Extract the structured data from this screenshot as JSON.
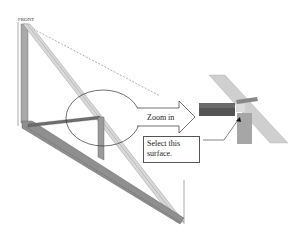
{
  "diagram": {
    "type": "cad-truss-zoom-callout",
    "labels": {
      "top_left_view": "FRONT",
      "bottom_right_view": "TOP"
    },
    "callouts": {
      "zoom_arrow_label": "Zoom in",
      "instruction_box": "Select this surface."
    },
    "colors": {
      "background": "#ffffff",
      "member_light": "#d4d4d4",
      "member_mid": "#a8a8a8",
      "member_dark": "#6e6e6e",
      "outline": "#444444"
    }
  }
}
